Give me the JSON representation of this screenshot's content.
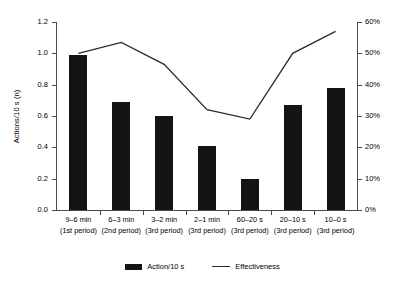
{
  "chart_data": {
    "type": "bar",
    "title": "",
    "subtitle": "",
    "xlabel": "",
    "ylabel": "Actions/10 s (n)",
    "y2label": "",
    "grid": false,
    "legend_position": "bottom",
    "categories": [
      "9–6 min",
      "6–3 min",
      "3–2 min",
      "2–1 min",
      "60–20 s",
      "20–10 s",
      "10–0 s"
    ],
    "category_sublabels": [
      "(1st period)",
      "(2nd period)",
      "(3rd period)",
      "(3rd period)",
      "(3rd period)",
      "(3rd period)",
      "(3rd period)"
    ],
    "ylim": [
      0,
      1.2
    ],
    "yticks": [
      0.0,
      0.2,
      0.4,
      0.6,
      0.8,
      1.0,
      1.2
    ],
    "ytick_labels": [
      "0.0",
      "0.2",
      "0.4",
      "0.6",
      "0.8",
      "1.0",
      "1.2"
    ],
    "y2lim": [
      0,
      60
    ],
    "y2ticks": [
      0,
      10,
      20,
      30,
      40,
      50,
      60
    ],
    "y2tick_labels": [
      "0%",
      "10%",
      "20%",
      "30%",
      "40%",
      "50%",
      "60%"
    ],
    "series": [
      {
        "name": "Action/10 s",
        "type": "bar",
        "axis": "left",
        "color": "#141414",
        "values": [
          0.99,
          0.69,
          0.6,
          0.41,
          0.2,
          0.67,
          0.78
        ]
      },
      {
        "name": "Effectiveness",
        "type": "line",
        "axis": "right",
        "color": "#2b2b2b",
        "values": [
          50,
          53.5,
          46.5,
          32,
          29,
          50,
          57
        ]
      }
    ]
  },
  "legend": {
    "entries": [
      {
        "label": "Action/10 s",
        "marker": "bar-swatch"
      },
      {
        "label": "Effectiveness",
        "marker": "line-swatch"
      }
    ]
  }
}
